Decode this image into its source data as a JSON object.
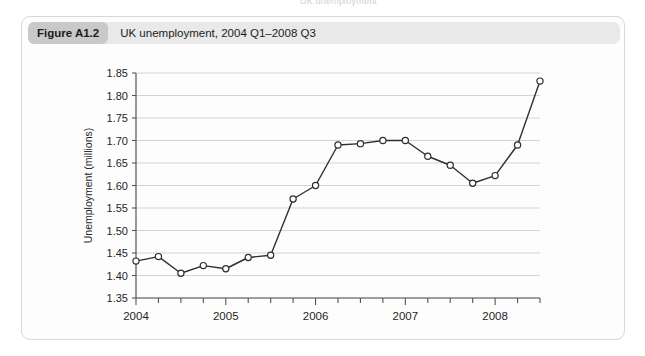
{
  "page": {
    "cut_off_header_text": "UK unemployment"
  },
  "figure": {
    "number_label": "Figure A1.2",
    "caption": "UK unemployment, 2004 Q1–2008 Q3"
  },
  "chart_data": {
    "type": "line",
    "title": "UK unemployment, 2004 Q1–2008 Q3",
    "xlabel": "",
    "ylabel": "Unemployment (millions)",
    "ylim": [
      1.35,
      1.85
    ],
    "ytick_labels": [
      "1.35",
      "1.40",
      "1.45",
      "1.50",
      "1.55",
      "1.60",
      "1.65",
      "1.70",
      "1.75",
      "1.80",
      "1.85"
    ],
    "ytick_values": [
      1.35,
      1.4,
      1.45,
      1.5,
      1.55,
      1.6,
      1.65,
      1.7,
      1.75,
      1.8,
      1.85
    ],
    "xtick_labels": [
      "2004",
      "2005",
      "2006",
      "2007",
      "2008"
    ],
    "xtick_values": [
      0,
      4,
      8,
      12,
      16
    ],
    "minor_ticks_per_year": 4,
    "xlim": [
      0,
      18
    ],
    "grid": "horizontal",
    "legend": "none",
    "marker": "open-circle",
    "line_color": "#2f2f2f",
    "grid_color": "#d3d3d3",
    "x": [
      0,
      1,
      2,
      3,
      4,
      5,
      6,
      7,
      8,
      9,
      10,
      11,
      12,
      13,
      14,
      15,
      16,
      17,
      18
    ],
    "quarters": [
      "2004 Q1",
      "2004 Q2",
      "2004 Q3",
      "2004 Q4",
      "2005 Q1",
      "2005 Q2",
      "2005 Q3",
      "2005 Q4",
      "2006 Q1",
      "2006 Q2",
      "2006 Q3",
      "2006 Q4",
      "2007 Q1",
      "2007 Q2",
      "2007 Q3",
      "2007 Q4",
      "2008 Q1",
      "2008 Q2",
      "2008 Q3"
    ],
    "values": [
      1.432,
      1.442,
      1.405,
      1.422,
      1.415,
      1.44,
      1.445,
      1.57,
      1.6,
      1.69,
      1.693,
      1.7,
      1.7,
      1.665,
      1.645,
      1.605,
      1.622,
      1.69,
      1.832
    ]
  }
}
